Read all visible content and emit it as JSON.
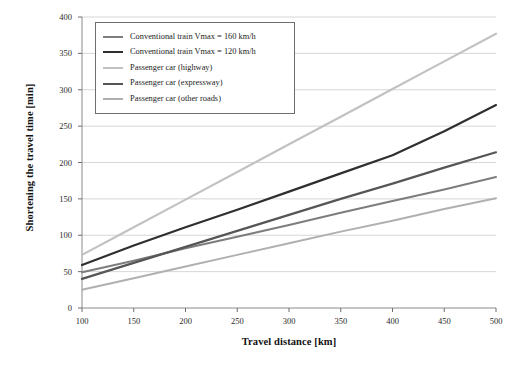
{
  "chart_data": {
    "type": "line",
    "title": "",
    "xlabel": "Travel distance [km]",
    "ylabel": "Shortening the travel time [min]",
    "xlim": [
      100,
      500
    ],
    "ylim": [
      0,
      400
    ],
    "xticks": [
      "100",
      "150",
      "200",
      "250",
      "300",
      "350",
      "400",
      "450",
      "500"
    ],
    "yticks": [
      "0",
      "50",
      "100",
      "150",
      "200",
      "250",
      "300",
      "350",
      "400"
    ],
    "grid": "horizontal",
    "legend_position": "top-left-inside",
    "x": [
      100,
      150,
      200,
      250,
      300,
      350,
      400,
      450,
      500
    ],
    "series": [
      {
        "name": "Conventional train Vmax = 160 km/h",
        "color": "#7d7d7d",
        "width": 2.0,
        "values": [
          49,
          65,
          82,
          98,
          114,
          131,
          147,
          163,
          180
        ]
      },
      {
        "name": "Conventional train Vmax = 120 km/h",
        "color": "#2f2f2f",
        "width": 2.2,
        "values": [
          59,
          86,
          111,
          135,
          160,
          185,
          210,
          243,
          279
        ]
      },
      {
        "name": "Passenger car (highway)",
        "color": "#c2c2c2",
        "width": 2.2,
        "values": [
          73,
          111,
          149,
          187,
          225,
          263,
          301,
          339,
          377
        ]
      },
      {
        "name": "Passenger car (expressway)",
        "color": "#565656",
        "width": 2.2,
        "values": [
          40,
          62,
          84,
          106,
          128,
          150,
          171,
          193,
          214
        ]
      },
      {
        "name": "Passenger car (other roads)",
        "color": "#b0b0b0",
        "width": 2.0,
        "values": [
          25,
          41,
          57,
          73,
          89,
          105,
          120,
          136,
          151
        ]
      }
    ]
  },
  "legend": {
    "items": [
      "Conventional train Vmax = 160 km/h",
      "Conventional train Vmax = 120 km/h",
      "Passenger car (highway)",
      "Passenger car (expressway)",
      "Passenger car (other roads)"
    ]
  },
  "axes": {
    "x_title": "Travel distance [km]",
    "y_title": "Shortening the travel time [min]"
  }
}
